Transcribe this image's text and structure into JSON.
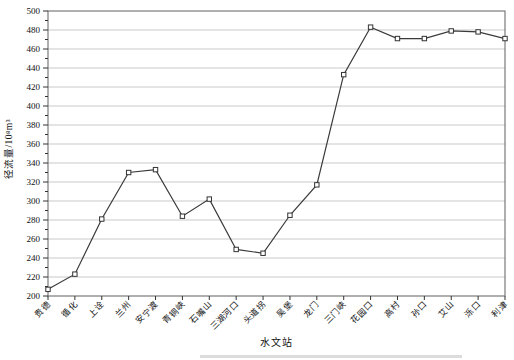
{
  "chart_data": {
    "type": "line",
    "title": "",
    "xlabel": "水文站",
    "ylabel": "径流量/10⁸m³",
    "categories": [
      "贵德",
      "循化",
      "上诠",
      "兰州",
      "安宁渡",
      "青铜峡",
      "石嘴山",
      "三湖河口",
      "头道拐",
      "吴堡",
      "龙门",
      "三门峡",
      "花园口",
      "高村",
      "孙口",
      "艾山",
      "泺口",
      "利津"
    ],
    "values": [
      207,
      223,
      281,
      330,
      333,
      284,
      302,
      249,
      245,
      285,
      317,
      433,
      483,
      471,
      471,
      479,
      478,
      471
    ],
    "ylim": [
      200,
      500
    ],
    "y_tick_step": 20,
    "y_minor_tick_step": 10,
    "grid": "horizontal-major",
    "legend": "none",
    "marker": "open-square",
    "colors": {
      "line": "#3a3a3a",
      "marker_fill": "#ffffff",
      "marker_stroke": "#333333",
      "grid": "#c9c9c9",
      "frame": "#6e6e6e",
      "tick": "#333333",
      "text": "#111111"
    }
  }
}
